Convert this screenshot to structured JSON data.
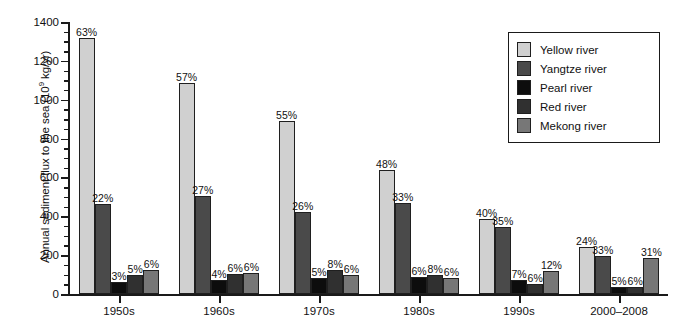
{
  "chart_data": {
    "type": "bar",
    "title": "",
    "subtitle": "",
    "xlabel": "",
    "ylabel": "Annual sediment flux to the sea (10⁹ kg/yr)",
    "ylabel_parts": {
      "pre": "Annual sediment flux to the sea (10",
      "sup": "9",
      "post": " kg/yr)"
    },
    "ylim": [
      0,
      1400
    ],
    "ytick_step": 200,
    "yminor_step": 50,
    "grid": false,
    "legend_position": "top-right",
    "categories": [
      "1950s",
      "1960s",
      "1970s",
      "1980s",
      "1990s",
      "2000–2008"
    ],
    "ytick_labels": [
      "0",
      "200",
      "400",
      "600",
      "800",
      "1000",
      "1200",
      "1400"
    ],
    "series": [
      {
        "name": "Yellow river",
        "color": "#d0d0d0",
        "values": [
          1320,
          1085,
          890,
          640,
          385,
          240
        ],
        "labels": [
          "63%",
          "57%",
          "55%",
          "48%",
          "40%",
          "24%"
        ]
      },
      {
        "name": "Yangtze river",
        "color": "#4a4a4a",
        "values": [
          463,
          505,
          420,
          470,
          345,
          196
        ],
        "labels": [
          "22%",
          "27%",
          "26%",
          "33%",
          "35%",
          "33%"
        ]
      },
      {
        "name": "Pearl river",
        "color": "#0d0d0d",
        "values": [
          62,
          74,
          84,
          88,
          72,
          34
        ],
        "labels": [
          "3%",
          "4%",
          "5%",
          "6%",
          "7%",
          "5%"
        ]
      },
      {
        "name": "Red river",
        "color": "#303030",
        "values": [
          96,
          105,
          126,
          100,
          54,
          36
        ],
        "labels": [
          "5%",
          "6%",
          "8%",
          "8%",
          "6%",
          "6%"
        ]
      },
      {
        "name": "Mekong river",
        "color": "#777777",
        "values": [
          126,
          110,
          98,
          80,
          118,
          186
        ],
        "labels": [
          "6%",
          "6%",
          "6%",
          "6%",
          "12%",
          "31%"
        ]
      }
    ]
  }
}
